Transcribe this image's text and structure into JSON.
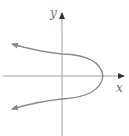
{
  "diagram": {
    "type": "coordinate-graph",
    "axes": {
      "x_label": "x",
      "y_label": "y"
    },
    "curve": {
      "shape": "parabola",
      "orientation": "opens-left",
      "vertex_position": "positive x-axis",
      "arrows_on_ends": true
    },
    "colors": {
      "axis": "#9a9a9a",
      "curve": "#8a8a8a",
      "label": "#6b6b6b",
      "background": "#ffffff"
    }
  }
}
